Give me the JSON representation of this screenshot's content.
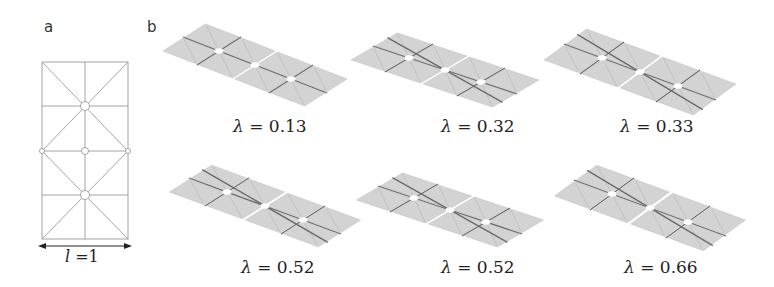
{
  "panels": {
    "a": {
      "label": "a",
      "caption_symbol": "l",
      "caption_value": " =1",
      "description": "Flat crease pattern: two stacked square cells, each with diagonals, a vertical midline, a horizontal midline and small circular holes at vertices"
    },
    "b": {
      "label": "b",
      "caption_symbol": "λ",
      "structures": [
        {
          "lambda_text": " = 0.13",
          "lambda": 0.13
        },
        {
          "lambda_text": " = 0.32",
          "lambda": 0.32
        },
        {
          "lambda_text": " = 0.33",
          "lambda": 0.33
        },
        {
          "lambda_text": " = 0.52",
          "lambda": 0.52
        },
        {
          "lambda_text": " = 0.52",
          "lambda": 0.52
        },
        {
          "lambda_text": " = 0.66",
          "lambda": 0.66
        }
      ]
    }
  },
  "colors": {
    "tile_fill": "#d3d3d3",
    "tile_edge": "#c4c4c4",
    "crease_dark": "#6a6a6a",
    "pattern_line": "#9a9a9a",
    "hole": "#ffffff",
    "arrow": "#222222"
  }
}
